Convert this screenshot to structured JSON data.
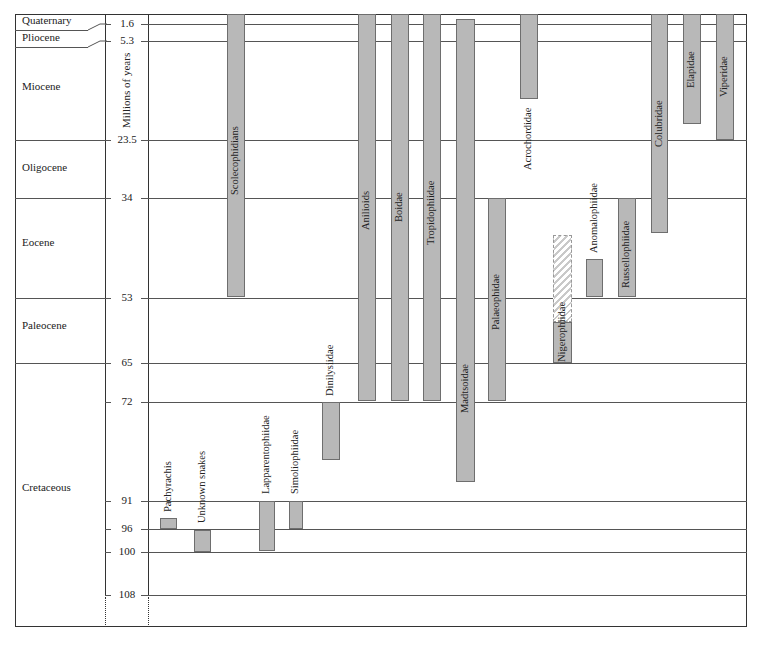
{
  "chart_data": {
    "type": "range-bar (geologic range chart)",
    "title": "",
    "ylabel": "Millions of years",
    "y_ticks": [
      1.6,
      5.3,
      23.5,
      34,
      53,
      65,
      72,
      91,
      96,
      100,
      108
    ],
    "y_tick_labels": [
      "1.6",
      "5.3",
      "23.5",
      "34",
      "53",
      "65",
      "72",
      "91",
      "96",
      "100",
      "108"
    ],
    "epochs": [
      {
        "name": "Quaternary",
        "start": 1.6,
        "end": 0
      },
      {
        "name": "Pliocene",
        "start": 5.3,
        "end": 1.6
      },
      {
        "name": "Miocene",
        "start": 23.5,
        "end": 5.3
      },
      {
        "name": "Oligocene",
        "start": 34,
        "end": 23.5
      },
      {
        "name": "Eocene",
        "start": 53,
        "end": 34
      },
      {
        "name": "Paleocene",
        "start": 65,
        "end": 53
      },
      {
        "name": "Cretaceous",
        "start": 108,
        "end": 65
      }
    ],
    "series": [
      {
        "name": "Pachyrachis",
        "oldest_mya": 97,
        "youngest_mya": 96
      },
      {
        "name": "Unknown snakes",
        "oldest_mya": 100,
        "youngest_mya": 96
      },
      {
        "name": "Lapparentophiidae",
        "oldest_mya": 100,
        "youngest_mya": 91
      },
      {
        "name": "Simoliophiidae",
        "oldest_mya": 96,
        "youngest_mya": 91
      },
      {
        "name": "Scolecophidians",
        "oldest_mya": 53,
        "youngest_mya": 0
      },
      {
        "name": "Dinilysiidae",
        "oldest_mya": 83,
        "youngest_mya": 72
      },
      {
        "name": "Anilioids",
        "oldest_mya": 72,
        "youngest_mya": 0
      },
      {
        "name": "Boidae",
        "oldest_mya": 72,
        "youngest_mya": 0
      },
      {
        "name": "Tropidophiidae",
        "oldest_mya": 72,
        "youngest_mya": 0
      },
      {
        "name": "Madtsoidae",
        "oldest_mya": 87,
        "youngest_mya": 1
      },
      {
        "name": "Palaeophidae",
        "oldest_mya": 72,
        "youngest_mya": 34
      },
      {
        "name": "Acrochordidae",
        "oldest_mya": 14,
        "youngest_mya": 0
      },
      {
        "name": "Nigerophiidae",
        "oldest_mya": 65,
        "youngest_mya": 58,
        "uncertain_extension_to_mya": 41
      },
      {
        "name": "Anomalophiidae",
        "oldest_mya": 53,
        "youngest_mya": 46
      },
      {
        "name": "Russellophiidae",
        "oldest_mya": 53,
        "youngest_mya": 34
      },
      {
        "name": "Colubridae",
        "oldest_mya": 40,
        "youngest_mya": 0
      },
      {
        "name": "Elapidae",
        "oldest_mya": 20,
        "youngest_mya": 0
      },
      {
        "name": "Viperidae",
        "oldest_mya": 23.5,
        "youngest_mya": 0
      }
    ],
    "grid": true,
    "legend": "none"
  },
  "axis": {
    "title": "Millions of years",
    "ticks": [
      {
        "label": "1.6",
        "y": 24
      },
      {
        "label": "5.3",
        "y": 41
      },
      {
        "label": "23.5",
        "y": 140
      },
      {
        "label": "34",
        "y": 198
      },
      {
        "label": "53",
        "y": 298
      },
      {
        "label": "65",
        "y": 363
      },
      {
        "label": "72",
        "y": 402
      },
      {
        "label": "91",
        "y": 501
      },
      {
        "label": "96",
        "y": 529
      },
      {
        "label": "100",
        "y": 552
      },
      {
        "label": "108",
        "y": 595
      }
    ]
  },
  "epochs": [
    {
      "label": "Quaternary",
      "y": 21
    },
    {
      "label": "Pliocene",
      "y": 38
    },
    {
      "label": "Miocene",
      "y": 87
    },
    {
      "label": "Oligocene",
      "y": 168
    },
    {
      "label": "Eocene",
      "y": 243
    },
    {
      "label": "Paleocene",
      "y": 326
    },
    {
      "label": "Cretaceous",
      "y": 488
    }
  ],
  "bars": [
    {
      "label": "Scolecophidians",
      "x": 227,
      "w": 18,
      "top": 14,
      "bottom": 297,
      "labelTop": 195
    },
    {
      "label": "Anilioids",
      "x": 358,
      "w": 18,
      "top": 14,
      "bottom": 401,
      "labelTop": 230
    },
    {
      "label": "Boidae",
      "x": 391,
      "w": 18,
      "top": 14,
      "bottom": 401,
      "labelTop": 222
    },
    {
      "label": "Tropidophiidae",
      "x": 423,
      "w": 18,
      "top": 14,
      "bottom": 401,
      "labelTop": 245
    },
    {
      "label": "Madtsoidae",
      "x": 456,
      "w": 19,
      "top": 19,
      "bottom": 482,
      "labelTop": 413
    },
    {
      "label": "Palaeophidae",
      "x": 488,
      "w": 18,
      "top": 198,
      "bottom": 401,
      "labelTop": 330
    },
    {
      "label": "Acrochordidae",
      "x": 520,
      "w": 18,
      "top": 14,
      "bottom": 99,
      "labelTop": 170,
      "labelOutside": true
    },
    {
      "label": "Nigerophiidae",
      "x": 553,
      "w": 19,
      "top": 322,
      "bottom": 363,
      "labelTop": 362
    },
    {
      "label": "Anomalophiidae",
      "x": 586,
      "w": 17,
      "top": 259,
      "bottom": 297,
      "labelTop": 253,
      "labelOutside": true
    },
    {
      "label": "Russellophiidae",
      "x": 618,
      "w": 18,
      "top": 198,
      "bottom": 297,
      "labelTop": 288
    },
    {
      "label": "Colubridae",
      "x": 651,
      "w": 17,
      "top": 14,
      "bottom": 233,
      "labelTop": 147
    },
    {
      "label": "Elapidae",
      "x": 683,
      "w": 18,
      "top": 14,
      "bottom": 124,
      "labelTop": 88
    },
    {
      "label": "Viperidae",
      "x": 716,
      "w": 18,
      "top": 14,
      "bottom": 140,
      "labelTop": 97
    },
    {
      "label": "Dinilysiidae",
      "x": 322,
      "w": 18,
      "top": 402,
      "bottom": 460,
      "labelTop": 396,
      "labelOutside": true
    },
    {
      "label": "Pachyrachis",
      "x": 160,
      "w": 17,
      "top": 518,
      "bottom": 529,
      "labelTop": 512,
      "labelOutside": true
    },
    {
      "label": "Unknown snakes",
      "x": 194,
      "w": 17,
      "top": 530,
      "bottom": 552,
      "labelTop": 523,
      "labelOutside": true
    },
    {
      "label": "Lapparentophiidae",
      "x": 259,
      "w": 16,
      "top": 501,
      "bottom": 551,
      "labelTop": 494,
      "labelOutside": true
    },
    {
      "label": "Simoliophiidae",
      "x": 289,
      "w": 14,
      "top": 501,
      "bottom": 529,
      "labelTop": 494,
      "labelOutside": true
    }
  ],
  "hatched_bars": [
    {
      "label": "Nigerophiidae (uncertain range)",
      "x": 553,
      "w": 19,
      "top": 235,
      "bottom": 322
    }
  ]
}
